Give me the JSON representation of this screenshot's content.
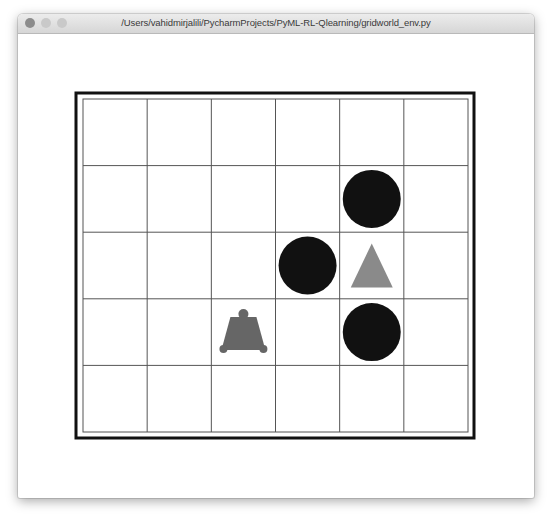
{
  "window": {
    "title": "/Users/vahidmirjalili/PycharmProjects/PyML-RL-Qlearning/gridworld_env.py",
    "traffic_lights": [
      "close-button",
      "minimize-button",
      "maximize-button"
    ]
  },
  "gridworld": {
    "rows": 5,
    "cols": 6,
    "colors": {
      "grid_line": "#555555",
      "border": "#111111",
      "trap": "#111111",
      "goal": "#8a8a8a",
      "agent": "#666666"
    },
    "objects": [
      {
        "type": "trap-circle",
        "row": 1,
        "col": 4
      },
      {
        "type": "trap-circle",
        "row": 2,
        "col": 3
      },
      {
        "type": "goal-triangle",
        "row": 2,
        "col": 4
      },
      {
        "type": "trap-circle",
        "row": 3,
        "col": 4
      },
      {
        "type": "agent-bell",
        "row": 3,
        "col": 2
      }
    ]
  }
}
